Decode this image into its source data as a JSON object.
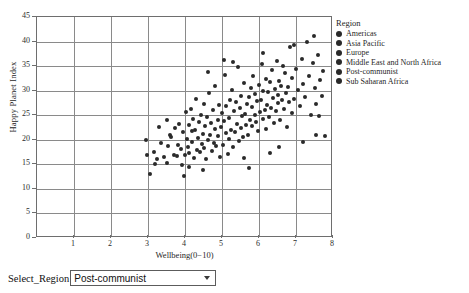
{
  "chart_data": {
    "type": "scatter",
    "title": "",
    "xlabel": "Wellbeing(0−10)",
    "ylabel": "Happy Planet Index",
    "xlim": [
      0,
      8
    ],
    "ylim": [
      0,
      45
    ],
    "xticks": [
      1,
      2,
      3,
      4,
      5,
      6,
      7,
      8
    ],
    "yticks": [
      0,
      5,
      10,
      15,
      20,
      25,
      30,
      35,
      40,
      45
    ],
    "grid": true,
    "legend_position": "right",
    "legend_title": "Region",
    "legend_entries": [
      "Americas",
      "Asia Pacific",
      "Europe",
      "Middle East and North Africa",
      "Post-communist",
      "Sub Saharan Africa"
    ],
    "point_color": "#2a2a2a",
    "points": [
      [
        2.95,
        20.0
      ],
      [
        3.05,
        13.0
      ],
      [
        3.15,
        17.6
      ],
      [
        3.25,
        16.0
      ],
      [
        3.35,
        19.3
      ],
      [
        3.42,
        16.4
      ],
      [
        3.5,
        15.2
      ],
      [
        3.55,
        18.8
      ],
      [
        3.6,
        21.0
      ],
      [
        3.62,
        20.6
      ],
      [
        3.7,
        17.0
      ],
      [
        3.72,
        22.4
      ],
      [
        3.78,
        16.6
      ],
      [
        3.8,
        19.0
      ],
      [
        3.85,
        23.2
      ],
      [
        3.88,
        18.2
      ],
      [
        3.92,
        14.9
      ],
      [
        3.95,
        21.5
      ],
      [
        4.0,
        16.8
      ],
      [
        4.02,
        25.6
      ],
      [
        4.05,
        20.1
      ],
      [
        4.08,
        18.6
      ],
      [
        4.1,
        23.0
      ],
      [
        4.12,
        17.3
      ],
      [
        4.15,
        26.2
      ],
      [
        4.18,
        21.8
      ],
      [
        4.2,
        19.6
      ],
      [
        4.22,
        24.3
      ],
      [
        4.25,
        16.2
      ],
      [
        4.28,
        22.0
      ],
      [
        4.3,
        28.4
      ],
      [
        4.32,
        18.0
      ],
      [
        4.35,
        20.4
      ],
      [
        4.38,
        23.6
      ],
      [
        4.4,
        17.5
      ],
      [
        4.42,
        25.0
      ],
      [
        4.45,
        19.2
      ],
      [
        4.48,
        21.2
      ],
      [
        4.5,
        27.3
      ],
      [
        4.52,
        18.4
      ],
      [
        4.55,
        22.8
      ],
      [
        4.58,
        16.0
      ],
      [
        4.6,
        24.6
      ],
      [
        4.62,
        20.0
      ],
      [
        4.65,
        29.6
      ],
      [
        4.68,
        21.0
      ],
      [
        4.7,
        23.4
      ],
      [
        4.72,
        17.8
      ],
      [
        4.75,
        26.0
      ],
      [
        4.78,
        19.4
      ],
      [
        4.8,
        22.2
      ],
      [
        4.82,
        31.0
      ],
      [
        4.85,
        18.8
      ],
      [
        4.88,
        24.0
      ],
      [
        4.9,
        20.8
      ],
      [
        4.92,
        27.0
      ],
      [
        4.95,
        16.5
      ],
      [
        4.98,
        22.6
      ],
      [
        5.0,
        25.4
      ],
      [
        5.02,
        19.0
      ],
      [
        5.05,
        23.8
      ],
      [
        5.08,
        33.2
      ],
      [
        5.1,
        21.4
      ],
      [
        5.12,
        26.8
      ],
      [
        5.15,
        17.2
      ],
      [
        5.18,
        24.4
      ],
      [
        5.2,
        20.2
      ],
      [
        5.22,
        28.0
      ],
      [
        5.25,
        22.0
      ],
      [
        5.28,
        30.2
      ],
      [
        5.3,
        18.5
      ],
      [
        5.32,
        25.8
      ],
      [
        5.35,
        21.6
      ],
      [
        5.38,
        27.6
      ],
      [
        5.4,
        23.2
      ],
      [
        5.42,
        34.8
      ],
      [
        5.45,
        19.8
      ],
      [
        5.48,
        26.4
      ],
      [
        5.5,
        22.4
      ],
      [
        5.52,
        29.0
      ],
      [
        5.55,
        24.8
      ],
      [
        5.58,
        20.6
      ],
      [
        5.6,
        31.6
      ],
      [
        5.62,
        25.2
      ],
      [
        5.65,
        23.0
      ],
      [
        5.68,
        27.2
      ],
      [
        5.7,
        21.0
      ],
      [
        5.72,
        28.8
      ],
      [
        5.75,
        24.0
      ],
      [
        5.78,
        30.6
      ],
      [
        5.8,
        22.8
      ],
      [
        5.82,
        26.6
      ],
      [
        5.85,
        33.0
      ],
      [
        5.88,
        25.0
      ],
      [
        5.9,
        29.4
      ],
      [
        5.92,
        23.6
      ],
      [
        5.95,
        27.8
      ],
      [
        5.98,
        21.8
      ],
      [
        6.0,
        31.2
      ],
      [
        6.02,
        25.6
      ],
      [
        6.05,
        28.2
      ],
      [
        6.08,
        35.4
      ],
      [
        6.1,
        24.2
      ],
      [
        6.12,
        30.0
      ],
      [
        6.15,
        26.0
      ],
      [
        6.18,
        22.2
      ],
      [
        6.2,
        32.4
      ],
      [
        6.22,
        27.0
      ],
      [
        6.25,
        29.8
      ],
      [
        6.28,
        24.6
      ],
      [
        6.3,
        31.8
      ],
      [
        6.32,
        26.4
      ],
      [
        6.35,
        34.2
      ],
      [
        6.38,
        28.6
      ],
      [
        6.4,
        23.4
      ],
      [
        6.42,
        30.4
      ],
      [
        6.45,
        25.8
      ],
      [
        6.48,
        36.0
      ],
      [
        6.5,
        29.2
      ],
      [
        6.52,
        27.4
      ],
      [
        6.55,
        32.0
      ],
      [
        6.58,
        24.0
      ],
      [
        6.6,
        31.0
      ],
      [
        6.62,
        28.0
      ],
      [
        6.65,
        35.0
      ],
      [
        6.68,
        26.2
      ],
      [
        6.7,
        33.6
      ],
      [
        6.72,
        29.6
      ],
      [
        6.75,
        22.6
      ],
      [
        6.78,
        30.8
      ],
      [
        6.8,
        27.6
      ],
      [
        6.85,
        38.8
      ],
      [
        6.88,
        25.4
      ],
      [
        6.9,
        32.6
      ],
      [
        6.95,
        28.4
      ],
      [
        7.0,
        34.4
      ],
      [
        7.05,
        30.2
      ],
      [
        7.1,
        26.8
      ],
      [
        7.15,
        36.4
      ],
      [
        7.2,
        31.4
      ],
      [
        7.25,
        28.8
      ],
      [
        7.3,
        40.0
      ],
      [
        7.35,
        33.0
      ],
      [
        7.4,
        25.0
      ],
      [
        7.45,
        35.6
      ],
      [
        7.5,
        30.6
      ],
      [
        7.55,
        27.2
      ],
      [
        7.6,
        37.2
      ],
      [
        7.65,
        32.2
      ],
      [
        7.7,
        29.0
      ],
      [
        7.72,
        34.0
      ],
      [
        7.78,
        20.8
      ],
      [
        7.55,
        21.0
      ],
      [
        7.2,
        19.6
      ],
      [
        6.55,
        18.6
      ],
      [
        6.3,
        17.4
      ],
      [
        5.72,
        14.2
      ],
      [
        5.6,
        16.2
      ],
      [
        4.48,
        13.8
      ],
      [
        4.1,
        14.4
      ],
      [
        3.98,
        12.6
      ],
      [
        7.62,
        24.8
      ],
      [
        7.48,
        41.2
      ],
      [
        6.95,
        39.4
      ],
      [
        5.3,
        35.8
      ],
      [
        4.62,
        33.8
      ],
      [
        5.05,
        36.2
      ],
      [
        6.12,
        37.6
      ],
      [
        3.3,
        22.6
      ],
      [
        3.5,
        24.0
      ],
      [
        3.18,
        15.0
      ],
      [
        2.98,
        16.8
      ]
    ]
  },
  "legend": {
    "title": "Region",
    "items": [
      {
        "label": "Americas"
      },
      {
        "label": "Asia Pacific"
      },
      {
        "label": "Europe"
      },
      {
        "label": "Middle East and North Africa"
      },
      {
        "label": "Post-communist"
      },
      {
        "label": "Sub Saharan Africa"
      }
    ]
  },
  "controls": {
    "select_label": "Select_Region",
    "selected_region": "Post-communist",
    "region_options": [
      "Americas",
      "Asia Pacific",
      "Europe",
      "Middle East and North Africa",
      "Post-communist",
      "Sub Saharan Africa"
    ],
    "dropdown_arrow_icon": "chevron-down-icon"
  },
  "colors": {
    "point": "#2a2a2a",
    "gridline": "#8a8a8a",
    "frame": "#6e6e6e",
    "text": "#1f1f1f",
    "background": "#ffffff"
  }
}
